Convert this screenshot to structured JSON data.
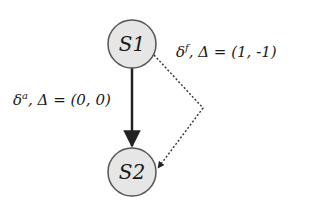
{
  "diagram": {
    "type": "state-transition",
    "nodes": [
      {
        "id": "S1",
        "label": "S1",
        "cx": 132,
        "cy": 44,
        "r": 24
      },
      {
        "id": "S2",
        "label": "S2",
        "cx": 132,
        "cy": 172,
        "r": 24
      }
    ],
    "edges": [
      {
        "from": "S1",
        "to": "S2",
        "style": "solid",
        "label_symbol": "δ",
        "label_sup": "a",
        "label_rest": ", Δ = (0, 0)"
      },
      {
        "from": "S1",
        "to": "S2",
        "style": "dotted",
        "label_symbol": "δ",
        "label_sup": "f",
        "label_rest": ", Δ = (1, -1)"
      }
    ]
  },
  "colors": {
    "node_fill": "#e6e6e6",
    "node_stroke": "#555555",
    "edge": "#222222",
    "text": "#1a1a1a"
  }
}
